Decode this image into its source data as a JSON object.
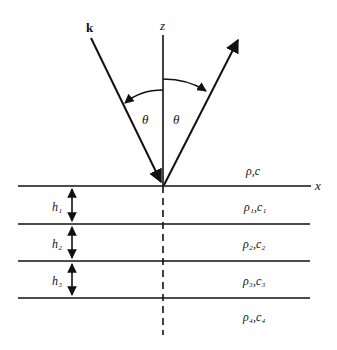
{
  "labels": {
    "wave_vector": "k",
    "z_axis": "z",
    "x_axis": "x",
    "angle_incident": "θ",
    "angle_reflected": "θ"
  },
  "layers": [
    {
      "medium": "ρ,c",
      "thickness_label": null
    },
    {
      "medium": "ρ₁,c₁",
      "thickness_label": "h₁"
    },
    {
      "medium": "ρ₂,c₂",
      "thickness_label": "h₂"
    },
    {
      "medium": "ρ₃,c₃",
      "thickness_label": "h₃"
    },
    {
      "medium": "ρ₄,c₄",
      "thickness_label": null
    }
  ]
}
